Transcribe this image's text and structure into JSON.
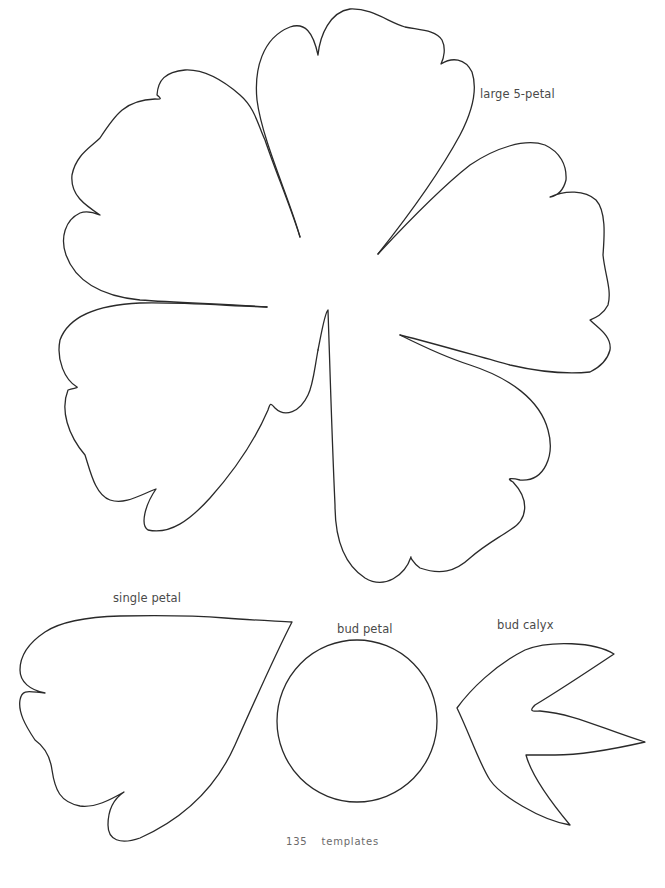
{
  "page": {
    "background": "#ffffff",
    "stroke_color": "#2a2a2a"
  },
  "templates": [
    {
      "id": "large-5-petal",
      "label": "large 5-petal"
    },
    {
      "id": "single-petal",
      "label": "single petal"
    },
    {
      "id": "bud-petal",
      "label": "bud petal"
    },
    {
      "id": "bud-calyx",
      "label": "bud calyx"
    }
  ],
  "footer": {
    "page_number": "135",
    "section": "templates"
  }
}
